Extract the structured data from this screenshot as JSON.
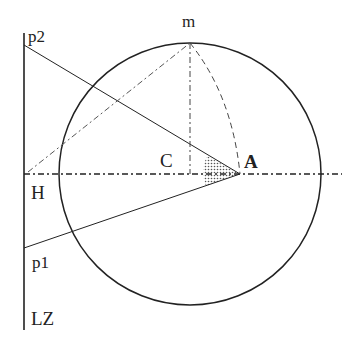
{
  "diagram": {
    "labels": {
      "p2": "p2",
      "m": "m",
      "C": "C",
      "A": "A",
      "H": "H",
      "p1": "p1",
      "LZ": "LZ"
    },
    "colors": {
      "stroke": "#222222",
      "background": "#ffffff",
      "hatch": "#555555"
    },
    "elements": [
      "vertical-line-LZ",
      "circle-centered-C",
      "horizontal-dash-dot-axis-H",
      "line-p2-to-A",
      "line-p1-to-A",
      "vertical-dash-dot-C-to-m",
      "dashed-arc-m-to-A",
      "dash-dot-line-H-to-m",
      "shaded-angle-at-A"
    ]
  }
}
